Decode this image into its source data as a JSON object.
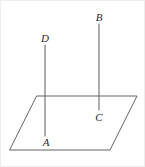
{
  "figure": {
    "kind": "geometry-diagram",
    "background_color": "#ffffff",
    "line_color": "#636363",
    "label_color": "#2a2a2a",
    "border_color": "#ededed",
    "canvas": {
      "width": 145,
      "height": 167
    },
    "plane": {
      "name": "plane-parallelogram",
      "points": "37,96 137,96 110,150 10,150"
    },
    "segments": [
      {
        "name": "segment-AD",
        "top_label": "D",
        "bottom_label": "A",
        "x1": 45,
        "y1": 45,
        "x2": 45,
        "y2": 136
      },
      {
        "name": "segment-BC",
        "top_label": "B",
        "bottom_label": "C",
        "x1": 99,
        "y1": 24,
        "x2": 99,
        "y2": 110
      }
    ],
    "labels": [
      {
        "id": "label-D",
        "text": "D",
        "x": 45,
        "y": 42
      },
      {
        "id": "label-B",
        "text": "B",
        "x": 99,
        "y": 21
      },
      {
        "id": "label-A",
        "text": "A",
        "x": 46,
        "y": 146
      },
      {
        "id": "label-C",
        "text": "C",
        "x": 99,
        "y": 121
      }
    ]
  }
}
